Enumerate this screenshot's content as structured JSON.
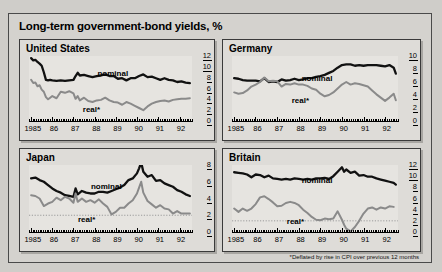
{
  "figure": {
    "title": "Long-term government-bond yields, %",
    "footnote": "*Deflated by rise in CPI over previous 12 months",
    "series_labels": {
      "nominal": "nominal",
      "real": "real*"
    },
    "colors": {
      "nominal": "#111111",
      "real": "#8a8a8a",
      "panel_bg": "#e6e4e0",
      "frame": "#3a3a3a",
      "figure_bg": "#d4d2ce"
    }
  },
  "chart_data": [
    {
      "type": "line",
      "title": "United States",
      "xlabel": "",
      "ylabel": "",
      "xlim": [
        1984.9,
        1992.6
      ],
      "ylim": [
        0,
        12
      ],
      "yticks": [
        0,
        2,
        4,
        6,
        8,
        10,
        12
      ],
      "ytick_labels": [
        "0",
        "2",
        "4",
        "6",
        "8",
        "10",
        "12"
      ],
      "xticks": [
        1985,
        1986,
        1987,
        1988,
        1989,
        1990,
        1991,
        1992
      ],
      "xtick_labels": [
        "1985",
        "86",
        "87",
        "88",
        "89",
        "90",
        "91",
        "92"
      ],
      "grid": false,
      "legend_position": "inline-annotation",
      "series": [
        {
          "name": "nominal",
          "x": [
            1985.0,
            1985.1,
            1985.2,
            1985.3,
            1985.4,
            1985.5,
            1985.6,
            1985.7,
            1985.8,
            1985.9,
            1986.0,
            1986.2,
            1986.4,
            1986.6,
            1986.8,
            1987.0,
            1987.1,
            1987.2,
            1987.3,
            1987.5,
            1987.7,
            1987.9,
            1988.1,
            1988.3,
            1988.5,
            1988.7,
            1988.9,
            1989.1,
            1989.3,
            1989.5,
            1989.7,
            1989.9,
            1990.1,
            1990.3,
            1990.5,
            1990.7,
            1990.9,
            1991.1,
            1991.3,
            1991.5,
            1991.7,
            1991.9,
            1992.1,
            1992.3,
            1992.5
          ],
          "values": [
            11.6,
            11.2,
            11.3,
            10.9,
            10.6,
            10.2,
            9.0,
            7.6,
            7.5,
            7.6,
            7.5,
            7.4,
            7.5,
            7.4,
            7.5,
            7.6,
            8.3,
            8.9,
            8.4,
            8.5,
            8.3,
            8.1,
            8.3,
            8.4,
            8.6,
            8.3,
            8.3,
            7.8,
            7.9,
            7.5,
            7.9,
            7.9,
            8.3,
            8.6,
            8.1,
            8.2,
            7.9,
            7.6,
            7.9,
            7.6,
            7.5,
            7.2,
            7.3,
            7.1,
            7.0
          ]
        },
        {
          "name": "real",
          "x": [
            1985.0,
            1985.1,
            1985.2,
            1985.3,
            1985.4,
            1985.5,
            1985.6,
            1985.7,
            1985.8,
            1985.9,
            1986.0,
            1986.2,
            1986.4,
            1986.6,
            1986.8,
            1987.0,
            1987.1,
            1987.2,
            1987.3,
            1987.5,
            1987.7,
            1987.9,
            1988.1,
            1988.3,
            1988.5,
            1988.7,
            1988.9,
            1989.1,
            1989.3,
            1989.5,
            1989.7,
            1989.9,
            1990.1,
            1990.3,
            1990.5,
            1990.7,
            1990.9,
            1991.1,
            1991.3,
            1991.5,
            1991.7,
            1991.9,
            1992.1,
            1992.3,
            1992.5
          ],
          "values": [
            7.6,
            7.0,
            7.1,
            6.4,
            6.6,
            5.8,
            5.4,
            4.4,
            4.0,
            4.3,
            4.6,
            4.2,
            5.4,
            5.2,
            5.5,
            5.1,
            4.1,
            4.6,
            3.8,
            4.3,
            3.7,
            3.5,
            3.8,
            3.9,
            4.3,
            3.8,
            3.5,
            3.4,
            3.0,
            3.5,
            3.2,
            2.8,
            2.4,
            2.0,
            2.7,
            3.2,
            3.5,
            3.7,
            3.8,
            3.6,
            3.9,
            4.0,
            4.1,
            4.1,
            4.2
          ]
        }
      ]
    },
    {
      "type": "line",
      "title": "Germany",
      "xlabel": "",
      "ylabel": "",
      "xlim": [
        1984.9,
        1992.6
      ],
      "ylim": [
        0,
        10
      ],
      "yticks": [
        0,
        2,
        4,
        6,
        8,
        10
      ],
      "ytick_labels": [
        "0",
        "2",
        "4",
        "6",
        "8",
        "10"
      ],
      "xticks": [
        1985,
        1986,
        1987,
        1988,
        1989,
        1990,
        1991,
        1992
      ],
      "xtick_labels": [
        "1985",
        "86",
        "87",
        "88",
        "89",
        "90",
        "91",
        "92"
      ],
      "grid": false,
      "legend_position": "inline-annotation",
      "series": [
        {
          "name": "nominal",
          "x": [
            1985.0,
            1985.2,
            1985.4,
            1985.6,
            1985.8,
            1986.0,
            1986.2,
            1986.4,
            1986.6,
            1986.8,
            1987.0,
            1987.2,
            1987.4,
            1987.6,
            1987.8,
            1988.0,
            1988.2,
            1988.4,
            1988.6,
            1988.8,
            1989.0,
            1989.2,
            1989.4,
            1989.6,
            1989.8,
            1990.0,
            1990.2,
            1990.4,
            1990.6,
            1990.8,
            1991.0,
            1991.2,
            1991.4,
            1991.6,
            1991.8,
            1992.0,
            1992.2,
            1992.4,
            1992.5
          ],
          "values": [
            6.6,
            6.5,
            6.3,
            6.2,
            6.2,
            6.2,
            6.1,
            6.6,
            6.0,
            6.1,
            6.0,
            6.4,
            6.2,
            6.3,
            6.5,
            6.3,
            6.4,
            6.6,
            6.6,
            6.8,
            6.9,
            7.1,
            7.4,
            7.7,
            8.2,
            8.6,
            8.7,
            8.7,
            8.5,
            8.6,
            8.5,
            8.6,
            8.6,
            8.6,
            8.5,
            8.4,
            8.6,
            8.2,
            7.3
          ]
        },
        {
          "name": "real",
          "x": [
            1985.0,
            1985.2,
            1985.4,
            1985.6,
            1985.8,
            1986.0,
            1986.2,
            1986.4,
            1986.6,
            1986.8,
            1987.0,
            1987.2,
            1987.4,
            1987.6,
            1987.8,
            1988.0,
            1988.2,
            1988.4,
            1988.6,
            1988.8,
            1989.0,
            1989.2,
            1989.4,
            1989.6,
            1989.8,
            1990.0,
            1990.2,
            1990.4,
            1990.6,
            1990.8,
            1991.0,
            1991.2,
            1991.4,
            1991.6,
            1991.8,
            1992.0,
            1992.2,
            1992.4,
            1992.5
          ],
          "values": [
            4.4,
            4.2,
            4.3,
            4.7,
            5.3,
            5.6,
            6.0,
            6.7,
            6.1,
            6.2,
            6.1,
            5.3,
            5.7,
            5.6,
            5.8,
            5.6,
            5.6,
            5.4,
            5.0,
            4.8,
            4.2,
            3.8,
            4.0,
            4.4,
            5.0,
            5.6,
            6.0,
            5.6,
            5.8,
            5.7,
            5.5,
            5.3,
            4.7,
            4.1,
            3.6,
            3.1,
            3.6,
            4.2,
            3.2
          ]
        }
      ]
    },
    {
      "type": "line",
      "title": "Japan",
      "xlabel": "",
      "ylabel": "",
      "xlim": [
        1984.9,
        1992.6
      ],
      "ylim": [
        0,
        8
      ],
      "yticks": [
        0,
        2,
        4,
        6,
        8
      ],
      "ytick_labels": [
        "0",
        "2",
        "4",
        "6",
        "8"
      ],
      "xticks": [
        1985,
        1986,
        1987,
        1988,
        1989,
        1990,
        1991,
        1992
      ],
      "xtick_labels": [
        "1985",
        "86",
        "87",
        "88",
        "89",
        "90",
        "91",
        "92"
      ],
      "grid": false,
      "dotted_gridline_y": 2,
      "legend_position": "inline-annotation",
      "series": [
        {
          "name": "nominal",
          "x": [
            1985.0,
            1985.2,
            1985.4,
            1985.6,
            1985.8,
            1986.0,
            1986.2,
            1986.4,
            1986.6,
            1986.8,
            1987.0,
            1987.1,
            1987.2,
            1987.4,
            1987.6,
            1987.8,
            1988.0,
            1988.2,
            1988.4,
            1988.6,
            1988.8,
            1989.0,
            1989.2,
            1989.4,
            1989.6,
            1989.8,
            1990.0,
            1990.1,
            1990.2,
            1990.3,
            1990.5,
            1990.7,
            1990.9,
            1991.1,
            1991.3,
            1991.5,
            1991.7,
            1991.9,
            1992.1,
            1992.3,
            1992.5
          ],
          "values": [
            6.4,
            6.5,
            6.2,
            6.0,
            5.6,
            5.2,
            4.9,
            4.7,
            4.4,
            4.3,
            4.2,
            5.2,
            4.5,
            4.9,
            4.7,
            4.6,
            4.6,
            4.8,
            4.8,
            4.7,
            4.9,
            5.1,
            5.3,
            5.6,
            6.2,
            6.4,
            7.0,
            7.6,
            8.3,
            7.2,
            6.6,
            6.8,
            6.1,
            6.2,
            5.8,
            5.6,
            5.4,
            5.0,
            4.8,
            4.5,
            4.3
          ]
        },
        {
          "name": "real",
          "x": [
            1985.0,
            1985.2,
            1985.4,
            1985.6,
            1985.8,
            1986.0,
            1986.2,
            1986.4,
            1986.6,
            1986.8,
            1987.0,
            1987.1,
            1987.2,
            1987.4,
            1987.6,
            1987.8,
            1988.0,
            1988.2,
            1988.4,
            1988.6,
            1988.8,
            1989.0,
            1989.2,
            1989.4,
            1989.6,
            1989.8,
            1990.0,
            1990.1,
            1990.2,
            1990.3,
            1990.5,
            1990.7,
            1990.9,
            1991.1,
            1991.3,
            1991.5,
            1991.7,
            1991.9,
            1992.1,
            1992.3,
            1992.5
          ],
          "values": [
            4.4,
            4.3,
            4.0,
            3.1,
            3.4,
            3.6,
            4.1,
            3.8,
            4.2,
            4.0,
            3.5,
            4.6,
            3.6,
            4.0,
            3.6,
            3.8,
            3.5,
            3.9,
            3.4,
            3.0,
            2.1,
            2.4,
            2.9,
            2.9,
            3.4,
            3.8,
            4.6,
            5.3,
            6.0,
            4.7,
            3.7,
            3.3,
            2.9,
            3.2,
            2.8,
            2.7,
            2.2,
            2.5,
            2.2,
            2.2,
            2.2
          ]
        }
      ]
    },
    {
      "type": "line",
      "title": "Britain",
      "xlabel": "",
      "ylabel": "",
      "xlim": [
        1984.9,
        1992.6
      ],
      "ylim": [
        0,
        12
      ],
      "yticks": [
        0,
        2,
        4,
        6,
        8,
        10,
        12
      ],
      "ytick_labels": [
        "0",
        "2",
        "4",
        "6",
        "8",
        "10",
        "12"
      ],
      "xticks": [
        1985,
        1986,
        1987,
        1988,
        1989,
        1990,
        1991,
        1992
      ],
      "xtick_labels": [
        "1985",
        "86",
        "87",
        "88",
        "89",
        "90",
        "91",
        "92"
      ],
      "grid": false,
      "dotted_gridline_y": 2,
      "legend_position": "inline-annotation",
      "series": [
        {
          "name": "nominal",
          "x": [
            1985.0,
            1985.2,
            1985.4,
            1985.6,
            1985.8,
            1986.0,
            1986.2,
            1986.4,
            1986.6,
            1986.8,
            1987.0,
            1987.2,
            1987.4,
            1987.6,
            1987.8,
            1988.0,
            1988.2,
            1988.4,
            1988.6,
            1988.8,
            1989.0,
            1989.2,
            1989.4,
            1989.6,
            1989.8,
            1990.0,
            1990.1,
            1990.2,
            1990.4,
            1990.6,
            1990.8,
            1991.0,
            1991.2,
            1991.4,
            1991.6,
            1991.8,
            1992.0,
            1992.2,
            1992.4,
            1992.5
          ],
          "values": [
            10.7,
            10.6,
            10.5,
            10.3,
            9.8,
            10.3,
            10.2,
            9.8,
            10.1,
            9.6,
            9.5,
            9.4,
            9.5,
            9.4,
            9.6,
            9.5,
            9.4,
            9.5,
            9.4,
            9.6,
            9.6,
            9.7,
            9.5,
            10.0,
            10.8,
            11.6,
            10.8,
            11.2,
            10.6,
            10.8,
            10.1,
            10.2,
            9.9,
            9.9,
            9.6,
            9.4,
            9.2,
            9.0,
            8.8,
            8.5
          ]
        },
        {
          "name": "real",
          "x": [
            1985.0,
            1985.2,
            1985.4,
            1985.6,
            1985.8,
            1986.0,
            1986.2,
            1986.4,
            1986.6,
            1986.8,
            1987.0,
            1987.2,
            1987.4,
            1987.6,
            1987.8,
            1988.0,
            1988.2,
            1988.4,
            1988.6,
            1988.8,
            1989.0,
            1989.2,
            1989.4,
            1989.6,
            1989.8,
            1990.0,
            1990.1,
            1990.2,
            1990.4,
            1990.6,
            1990.8,
            1991.0,
            1991.2,
            1991.4,
            1991.6,
            1991.8,
            1992.0,
            1992.2,
            1992.4,
            1992.5
          ],
          "values": [
            4.2,
            3.6,
            4.2,
            3.8,
            4.2,
            5.0,
            6.2,
            6.4,
            5.9,
            5.3,
            4.6,
            4.7,
            5.2,
            5.4,
            5.2,
            4.8,
            4.0,
            3.4,
            2.7,
            2.2,
            2.1,
            2.4,
            2.3,
            2.4,
            3.7,
            2.2,
            1.3,
            0.6,
            0.1,
            0.9,
            2.0,
            3.3,
            4.2,
            4.4,
            4.0,
            4.4,
            4.2,
            4.6,
            4.5
          ]
        }
      ]
    }
  ]
}
